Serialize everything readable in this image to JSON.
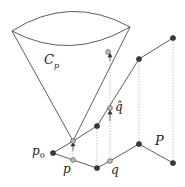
{
  "labels": {
    "cone": "C",
    "cone_sub": "p",
    "p0": "p",
    "p0_sub": "0",
    "p": "p",
    "q": "q",
    "q_hat": "q̂",
    "P": "P"
  },
  "colors": {
    "line": "#333333",
    "dark_point": "#3a3a3a",
    "light_point": "#bdbdbd",
    "dotted": "#9a9a9a"
  }
}
